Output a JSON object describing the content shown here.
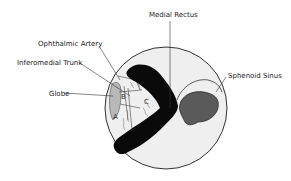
{
  "labels": {
    "medial_rectus": "Medial Rectus",
    "ophthalmic_artery": "Ophthalmic Artery",
    "inferomedial_trunk": "Inferomedial Trunk",
    "globe": "Globe",
    "sphenoid_sinus": "Sphenoid Sinus"
  },
  "regions": {
    "a": "A",
    "b": "B",
    "c": "C"
  },
  "colors": {
    "background": "#ffffff",
    "circle_fill": "#efefef",
    "outline": "#333333",
    "muscle": "#0a0a0a",
    "globe": "#b8b8b8",
    "sinus": "#5a5a5a",
    "leader_line": "#333333"
  }
}
